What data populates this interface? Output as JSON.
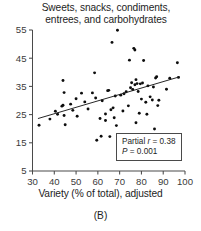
{
  "chart_data": {
    "type": "scatter",
    "title": "Sweets, snacks, condiments, entrees, and carbohydrates",
    "title_line1": "Sweets, snacks, condiments,",
    "title_line2": "entrees, and carbohydrates",
    "xlabel": "Variety (% of total), adjusted",
    "ylabel": "",
    "panel_label": "(B)",
    "xlim": [
      30,
      100
    ],
    "ylim": [
      5,
      55
    ],
    "xticks": [
      30,
      40,
      50,
      60,
      70,
      80,
      90,
      100
    ],
    "yticks": [
      5,
      15,
      25,
      35,
      45,
      55
    ],
    "grid": false,
    "legend": "none",
    "point_color": "#0d0d0d",
    "line_color": "#1a1a1a",
    "axis_color": "#4a4a4a",
    "annotation": {
      "partial_r_prefix": "Partial ",
      "partial_r_symbol": "r",
      "partial_r_value": " = 0.38",
      "p_symbol": "P",
      "p_value": " = 0.001",
      "r": 0.38,
      "p": 0.001
    },
    "regression_line": {
      "x_start": 32.5,
      "y_start": 23.6,
      "x_end": 97.5,
      "y_end": 38.4
    },
    "points": [
      [
        33.0,
        21.2
      ],
      [
        38.0,
        23.4
      ],
      [
        40.5,
        26.2
      ],
      [
        41.5,
        25.1
      ],
      [
        43.5,
        28.0
      ],
      [
        44.0,
        28.3
      ],
      [
        44.0,
        37.1
      ],
      [
        44.5,
        32.8
      ],
      [
        44.5,
        24.7
      ],
      [
        45.0,
        21.4
      ],
      [
        47.5,
        28.7
      ],
      [
        48.5,
        26.5
      ],
      [
        50.0,
        30.6
      ],
      [
        50.5,
        24.4
      ],
      [
        52.5,
        32.6
      ],
      [
        54.0,
        29.5
      ],
      [
        55.5,
        27.0
      ],
      [
        57.5,
        32.7
      ],
      [
        58.5,
        39.8
      ],
      [
        59.0,
        30.9
      ],
      [
        59.5,
        15.9
      ],
      [
        61.0,
        23.6
      ],
      [
        61.5,
        17.3
      ],
      [
        62.0,
        29.9
      ],
      [
        63.5,
        25.2
      ],
      [
        63.5,
        22.9
      ],
      [
        64.5,
        33.5
      ],
      [
        65.0,
        33.6
      ],
      [
        65.5,
        17.2
      ],
      [
        66.0,
        26.7
      ],
      [
        66.5,
        50.6
      ],
      [
        67.0,
        27.4
      ],
      [
        67.5,
        23.9
      ],
      [
        68.0,
        31.6
      ],
      [
        68.5,
        21.1
      ],
      [
        69.0,
        54.9
      ],
      [
        69.5,
        11.2
      ],
      [
        70.5,
        31.9
      ],
      [
        71.5,
        26.3
      ],
      [
        72.0,
        32.4
      ],
      [
        73.0,
        33.1
      ],
      [
        74.0,
        28.1
      ],
      [
        74.5,
        44.3
      ],
      [
        75.0,
        34.5
      ],
      [
        75.5,
        36.3
      ],
      [
        76.0,
        33.9
      ],
      [
        76.5,
        48.5
      ],
      [
        77.0,
        47.9
      ],
      [
        77.0,
        35.6
      ],
      [
        77.5,
        37.4
      ],
      [
        77.5,
        22.1
      ],
      [
        78.0,
        36.0
      ],
      [
        78.5,
        33.2
      ],
      [
        79.0,
        25.5
      ],
      [
        79.5,
        35.9
      ],
      [
        80.0,
        30.5
      ],
      [
        80.5,
        36.2
      ],
      [
        81.0,
        44.2
      ],
      [
        82.0,
        29.4
      ],
      [
        82.5,
        25.1
      ],
      [
        83.0,
        35.2
      ],
      [
        84.0,
        31.3
      ],
      [
        85.0,
        30.2
      ],
      [
        85.5,
        34.8
      ],
      [
        86.0,
        19.9
      ],
      [
        86.5,
        38.0
      ],
      [
        87.0,
        38.4
      ],
      [
        87.5,
        28.2
      ],
      [
        88.0,
        30.1
      ],
      [
        91.5,
        34.0
      ],
      [
        93.0,
        37.9
      ],
      [
        96.5,
        43.4
      ],
      [
        97.0,
        38.2
      ]
    ]
  }
}
